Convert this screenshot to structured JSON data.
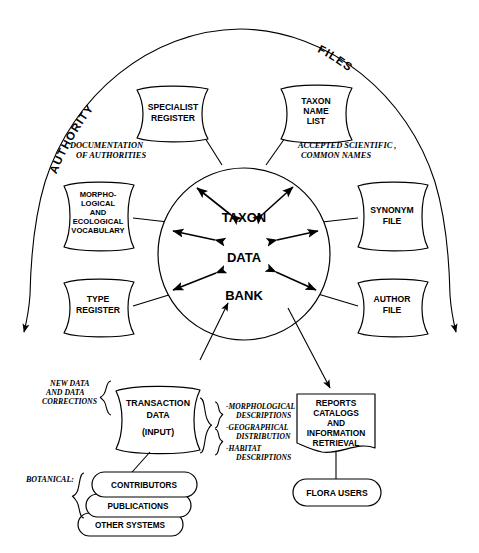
{
  "diagram": {
    "arc_labels": {
      "left": "AUTHORITY",
      "right": "FILES"
    },
    "center": {
      "line1": "TAXON",
      "line2": "DATA",
      "line3": "BANK"
    },
    "authority_files": [
      {
        "id": "specialist-register",
        "label": "SPECIALIST\nREGISTER",
        "lines": [
          "SPECIALIST",
          "REGISTER"
        ]
      },
      {
        "id": "taxon-name-list",
        "label": "TAXON NAME LIST",
        "lines": [
          "TAXON",
          "NAME",
          "LIST"
        ]
      },
      {
        "id": "morphological-ecological-vocabulary",
        "label": "MORPHO-LOGICAL AND ECOLOGICAL VOCABULARY",
        "lines": [
          "MORPHO-",
          "LOGICAL",
          "AND",
          "ECOLOGICAL",
          "VOCABULARY"
        ]
      },
      {
        "id": "synonym-file",
        "label": "SYNONYM FILE",
        "lines": [
          "SYNONYM",
          "FILE"
        ]
      },
      {
        "id": "type-register",
        "label": "TYPE REGISTER",
        "lines": [
          "TYPE",
          "REGISTER"
        ]
      },
      {
        "id": "author-file",
        "label": "AUTHOR FILE",
        "lines": [
          "AUTHOR",
          "FILE"
        ]
      }
    ],
    "annotations": {
      "documentation_of_authorities": [
        "DOCUMENTATION",
        "OF AUTHORITIES"
      ],
      "accepted_names": [
        "ACCEPTED SCIENTIFIC ,",
        "COMMON NAMES"
      ],
      "new_data": [
        "NEW DATA",
        "AND DATA",
        "CORRECTIONS"
      ],
      "botanical": "BOTANICAL:",
      "transaction_detail": [
        [
          "-MORPHOLOGICAL",
          "DESCRIPTIONS"
        ],
        [
          "-GEOGRAPHICAL",
          "DISTRIBUTION"
        ],
        [
          "-HABITAT",
          "DESCRIPTIONS"
        ]
      ]
    },
    "transaction": {
      "id": "transaction-data",
      "lines": [
        "TRANSACTION",
        "DATA",
        "(INPUT)"
      ]
    },
    "sources": [
      {
        "id": "contributors",
        "label": "CONTRIBUTORS"
      },
      {
        "id": "publications",
        "label": "PUBLICATIONS"
      },
      {
        "id": "other-systems",
        "label": "OTHER SYSTEMS"
      }
    ],
    "output": {
      "id": "reports-catalogs",
      "lines": [
        "REPORTS",
        "CATALOGS",
        "AND",
        "INFORMATION",
        "RETRIEVAL"
      ]
    },
    "users": {
      "id": "flora-users",
      "label": "FLORA USERS"
    },
    "colors": {
      "ink": "#000000",
      "paper": "#ffffff"
    }
  }
}
